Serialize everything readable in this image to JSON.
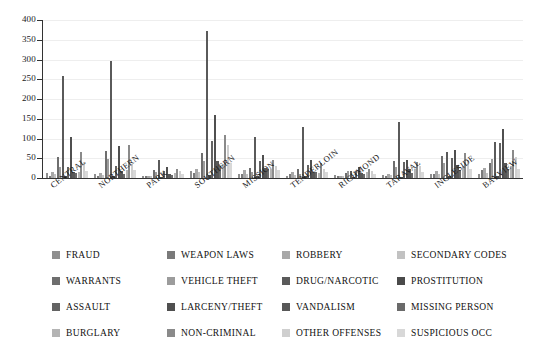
{
  "chart_data": {
    "type": "bar",
    "title": "",
    "subtitle": "",
    "xlabel": "",
    "ylabel": "",
    "ylim": [
      0,
      400
    ],
    "ytick_values": [
      0,
      50,
      100,
      150,
      200,
      250,
      300,
      350,
      400
    ],
    "ytick_labels": [
      "0",
      "50",
      "100",
      "150",
      "200",
      "250",
      "300",
      "350",
      "400"
    ],
    "grid": true,
    "grid_axis": "y",
    "legend_position": "bottom",
    "legend_columns": 4,
    "categories": [
      "CENTRAL",
      "NORTHERN",
      "PARK",
      "SOUTHERN",
      "MISSION",
      "TENDERLOIN",
      "RICHMOND",
      "TARAVAL",
      "INGLESIDE",
      "BAYVIEW"
    ],
    "series": [
      {
        "name": "FRAUD",
        "color": "#8f8f8f",
        "values": [
          12,
          9,
          5,
          18,
          10,
          6,
          7,
          8,
          9,
          10
        ]
      },
      {
        "name": "WEAPON LAWS",
        "color": "#7a7a7a",
        "values": [
          5,
          6,
          4,
          12,
          10,
          9,
          4,
          6,
          10,
          20
        ]
      },
      {
        "name": "ROBBERY",
        "color": "#a8a8a8",
        "values": [
          14,
          12,
          6,
          22,
          20,
          14,
          6,
          10,
          18,
          26
        ]
      },
      {
        "name": "SECONDARY CODES",
        "color": "#c2c2c2",
        "values": [
          9,
          7,
          4,
          14,
          10,
          7,
          5,
          7,
          9,
          12
        ]
      },
      {
        "name": "WARRANTS",
        "color": "#6e6e6e",
        "values": [
          54,
          68,
          20,
          63,
          26,
          22,
          13,
          44,
          55,
          37
        ]
      },
      {
        "name": "VEHICLE THEFT",
        "color": "#9c9c9c",
        "values": [
          28,
          48,
          14,
          44,
          16,
          10,
          17,
          27,
          38,
          47
        ]
      },
      {
        "name": "DRUG/NARCOTIC",
        "color": "#5a5a5a",
        "values": [
          259,
          295,
          45,
          373,
          104,
          128,
          18,
          141,
          66,
          90
        ]
      },
      {
        "name": "PROSTITUTION",
        "color": "#4a4a4a",
        "values": [
          4,
          6,
          2,
          8,
          5,
          4,
          2,
          3,
          5,
          6
        ]
      },
      {
        "name": "ASSAULT",
        "color": "#636363",
        "values": [
          27,
          30,
          18,
          93,
          42,
          34,
          19,
          40,
          50,
          88
        ]
      },
      {
        "name": "LARCENY/THEFT",
        "color": "#4f4f4f",
        "values": [
          103,
          80,
          29,
          159,
          59,
          45,
          27,
          46,
          70,
          124
        ]
      },
      {
        "name": "VANDALISM",
        "color": "#585858",
        "values": [
          14,
          17,
          10,
          42,
          26,
          15,
          13,
          23,
          32,
          39
        ]
      },
      {
        "name": "MISSING PERSON",
        "color": "#6a6a6a",
        "values": [
          12,
          10,
          7,
          30,
          22,
          14,
          9,
          12,
          20,
          24
        ]
      },
      {
        "name": "BURGLARY",
        "color": "#b4b4b4",
        "values": [
          16,
          20,
          12,
          35,
          24,
          12,
          16,
          22,
          30,
          30
        ]
      },
      {
        "name": "NON-CRIMINAL",
        "color": "#8a8a8a",
        "values": [
          66,
          84,
          24,
          108,
          46,
          38,
          22,
          41,
          64,
          70
        ]
      },
      {
        "name": "OTHER OFFENSES",
        "color": "#cfcfcf",
        "values": [
          41,
          35,
          18,
          83,
          30,
          24,
          18,
          30,
          46,
          53
        ]
      },
      {
        "name": "SUSPICIOUS OCC",
        "color": "#d8d8d8",
        "values": [
          19,
          20,
          10,
          38,
          20,
          14,
          10,
          16,
          24,
          22
        ]
      }
    ]
  },
  "legend": {
    "items": [
      {
        "label": "FRAUD",
        "color": "#8f8f8f"
      },
      {
        "label": "WEAPON LAWS",
        "color": "#7a7a7a"
      },
      {
        "label": "ROBBERY",
        "color": "#a8a8a8"
      },
      {
        "label": "SECONDARY CODES",
        "color": "#c2c2c2"
      },
      {
        "label": "WARRANTS",
        "color": "#6e6e6e"
      },
      {
        "label": "VEHICLE THEFT",
        "color": "#9c9c9c"
      },
      {
        "label": "DRUG/NARCOTIC",
        "color": "#5a5a5a"
      },
      {
        "label": "PROSTITUTION",
        "color": "#4a4a4a"
      },
      {
        "label": "ASSAULT",
        "color": "#636363"
      },
      {
        "label": "LARCENY/THEFT",
        "color": "#4f4f4f"
      },
      {
        "label": "VANDALISM",
        "color": "#585858"
      },
      {
        "label": "MISSING PERSON",
        "color": "#6a6a6a"
      },
      {
        "label": "BURGLARY",
        "color": "#b4b4b4"
      },
      {
        "label": "NON-CRIMINAL",
        "color": "#8a8a8a"
      },
      {
        "label": "OTHER OFFENSES",
        "color": "#cfcfcf"
      },
      {
        "label": "SUSPICIOUS OCC",
        "color": "#d8d8d8"
      }
    ]
  }
}
